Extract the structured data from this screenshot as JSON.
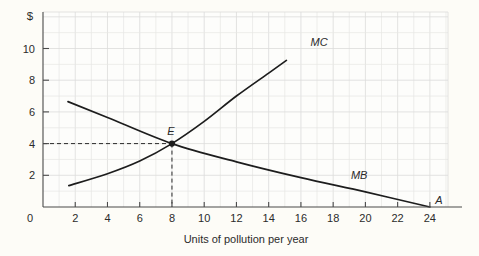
{
  "chart_data": {
    "type": "line",
    "title": "",
    "xlabel": "Units of pollution per year",
    "ylabel": "$",
    "xlim": [
      0,
      26
    ],
    "ylim": [
      0,
      11.5
    ],
    "grid": true,
    "legend": "inline-curve-labels",
    "x_ticks": [
      2,
      4,
      6,
      8,
      10,
      12,
      14,
      16,
      18,
      20,
      22,
      24
    ],
    "y_ticks": [
      2,
      4,
      6,
      8,
      10
    ],
    "origin_label": "0",
    "series": [
      {
        "name": "MC",
        "label": "MC",
        "label_point": {
          "x": 16.6,
          "y": 10.15
        },
        "points": [
          {
            "x": 1.6,
            "y": 1.35
          },
          {
            "x": 4.0,
            "y": 2.1
          },
          {
            "x": 6.0,
            "y": 2.9
          },
          {
            "x": 8.0,
            "y": 4.0
          },
          {
            "x": 10.0,
            "y": 5.4
          },
          {
            "x": 12.0,
            "y": 7.0
          },
          {
            "x": 14.0,
            "y": 8.45
          },
          {
            "x": 15.1,
            "y": 9.25
          }
        ]
      },
      {
        "name": "MB",
        "label": "MB",
        "label_point": {
          "x": 19.1,
          "y": 1.75
        },
        "points": [
          {
            "x": 1.55,
            "y": 6.65
          },
          {
            "x": 4.0,
            "y": 5.65
          },
          {
            "x": 8.0,
            "y": 4.0
          },
          {
            "x": 12.0,
            "y": 2.85
          },
          {
            "x": 16.0,
            "y": 1.85
          },
          {
            "x": 20.0,
            "y": 0.95
          },
          {
            "x": 24.0,
            "y": 0.0
          }
        ]
      }
    ],
    "annotations": [
      {
        "name": "equilibrium-point",
        "label": "E",
        "x": 8,
        "y": 4,
        "dot": true,
        "guide_lines": [
          "horizontal-to-y-axis",
          "vertical-to-x-axis"
        ]
      },
      {
        "name": "endpoint-a",
        "label": "A",
        "x": 24,
        "y": 0,
        "dot": false
      }
    ]
  },
  "axes": {
    "y_axis_symbol": "$",
    "x_axis_title": "Units of pollution per year"
  },
  "colors": {
    "curve": "#1d1d1d",
    "axis": "#4a4a4a",
    "grid": "#e6e6e4",
    "background": "#fdfcf7"
  }
}
